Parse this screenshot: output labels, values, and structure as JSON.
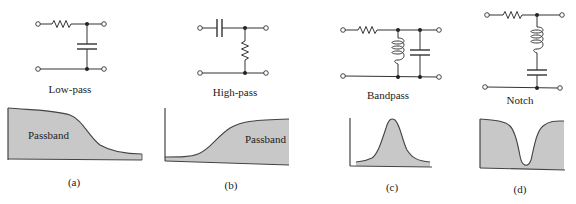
{
  "figure": {
    "panels": [
      {
        "id": "a",
        "circuit_label": "Low-pass",
        "passband_label": "Passband",
        "panel_label": "(a)",
        "components": [
          "resistor-series",
          "capacitor-shunt"
        ]
      },
      {
        "id": "b",
        "circuit_label": "High-pass",
        "passband_label": "Passband",
        "panel_label": "(b)",
        "components": [
          "capacitor-series",
          "resistor-shunt"
        ]
      },
      {
        "id": "c",
        "circuit_label": "Bandpass",
        "passband_label": "",
        "panel_label": "(c)",
        "components": [
          "resistor-series",
          "inductor-shunt",
          "capacitor-shunt"
        ]
      },
      {
        "id": "d",
        "circuit_label": "Notch",
        "passband_label": "",
        "panel_label": "(d)",
        "components": [
          "resistor-series",
          "inductor-shunt-series-capacitor"
        ]
      }
    ],
    "colors": {
      "fill": "#c8c8c8",
      "line": "#333333",
      "background": "#ffffff"
    }
  }
}
